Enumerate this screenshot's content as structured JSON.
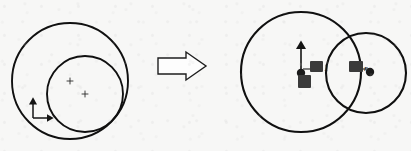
{
  "figure": {
    "background_color": "#f7f7f6",
    "ink_color": "#101010",
    "arrow_color": "#1a1a1a",
    "marker_color": "#333333"
  },
  "left_panel": {
    "name": "source-configuration",
    "caption": "",
    "outer_circle": {
      "label": "outer-circle",
      "cx": 70,
      "cy": 81,
      "r": 58
    },
    "inner_circle": {
      "label": "inner-circle",
      "cx": 85,
      "cy": 94,
      "r": 38
    },
    "center_markers": [
      {
        "label": "center-mark-upper",
        "glyph": "+",
        "x": 70,
        "y": 81
      },
      {
        "label": "center-mark-lower",
        "glyph": "+",
        "x": 85,
        "y": 94
      }
    ],
    "axes_gizmo": {
      "label": "coordinate-axes",
      "origin_x": 33,
      "origin_y": 118,
      "y_tip_y": 98,
      "x_tip_x": 53,
      "x_label": "",
      "y_label": ""
    }
  },
  "transform_arrow": {
    "name": "implies-arrow",
    "glyph": "⟹",
    "direction": "right",
    "x": 158,
    "y": 63,
    "width": 48,
    "height": 22,
    "style": "hollow-outline"
  },
  "right_panel": {
    "name": "result-configuration",
    "caption": "",
    "left_circle": {
      "label": "left-circle",
      "cx": 301,
      "cy": 72,
      "r": 60
    },
    "right_circle": {
      "label": "right-circle",
      "cx": 366,
      "cy": 73,
      "r": 40
    },
    "points": [
      {
        "label": "left-center-point",
        "x": 301,
        "y": 73,
        "r": 4.2
      },
      {
        "label": "right-center-point",
        "x": 370,
        "y": 72,
        "r": 4.2
      }
    ],
    "up_arrow": {
      "label": "vertical-axis-arrow",
      "x": 301,
      "base_y": 73,
      "tip_y": 41
    },
    "annotations": [
      {
        "name": "radius-label-left",
        "text": "1",
        "x": 318,
        "y": 68,
        "obscured": true
      },
      {
        "name": "radius-label-right",
        "text": "r",
        "x": 361,
        "y": 68,
        "obscured": true
      },
      {
        "name": "origin-label",
        "text": "",
        "x": 302,
        "y": 83,
        "obscured": true
      }
    ],
    "obscured_blocks": [
      {
        "name": "smudge-block-left",
        "x": 310,
        "y": 61,
        "w": 13,
        "h": 11
      },
      {
        "name": "smudge-block-right",
        "x": 349,
        "y": 61,
        "w": 14,
        "h": 11
      },
      {
        "name": "smudge-block-bottom",
        "x": 298,
        "y": 75,
        "w": 13,
        "h": 13
      }
    ]
  }
}
